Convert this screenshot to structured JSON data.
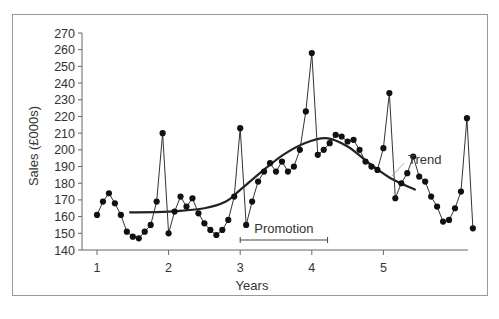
{
  "chart_data": {
    "type": "line",
    "title": "",
    "xlabel": "Years",
    "ylabel": "Sales (£000s)",
    "ylim": [
      140,
      270
    ],
    "xlim": [
      1,
      5.95
    ],
    "y_ticks": [
      140,
      150,
      160,
      170,
      180,
      190,
      200,
      210,
      220,
      230,
      240,
      250,
      260,
      270
    ],
    "x_ticks": [
      1,
      2,
      3,
      4,
      5
    ],
    "grid": false,
    "legend": null,
    "series": [
      {
        "name": "Sales",
        "style": "line-with-markers",
        "x_step": 0.0833,
        "x_start": 1,
        "values": [
          161,
          169,
          174,
          168,
          161,
          151,
          148,
          147,
          151,
          155,
          169,
          210,
          150,
          163,
          172,
          166,
          171,
          162,
          156,
          152,
          149,
          152,
          158,
          172,
          213,
          155,
          169,
          181,
          187,
          192,
          187,
          193,
          187,
          190,
          200,
          223,
          258,
          197,
          200,
          204,
          209,
          208,
          205,
          206,
          200,
          193,
          190,
          188,
          201,
          234,
          171,
          180,
          186,
          196,
          184,
          181,
          172,
          166,
          157,
          158,
          165,
          175,
          219,
          153
        ]
      },
      {
        "name": "Trend",
        "style": "smooth-curve",
        "x": [
          1.45,
          2.0,
          2.5,
          2.8,
          3.0,
          3.3,
          3.6,
          3.9,
          4.2,
          4.5,
          4.8,
          5.1,
          5.45
        ],
        "values": [
          162.5,
          163,
          165,
          169,
          176,
          187,
          197,
          204,
          207,
          202,
          192,
          183,
          176
        ]
      }
    ],
    "annotations": [
      {
        "text": "Trend",
        "x": 5.35,
        "y": 194,
        "type": "label-with-leader"
      },
      {
        "text": "Promotion",
        "x_start": 3.0,
        "x_end": 4.22,
        "y": 148,
        "type": "range-bracket"
      }
    ]
  }
}
